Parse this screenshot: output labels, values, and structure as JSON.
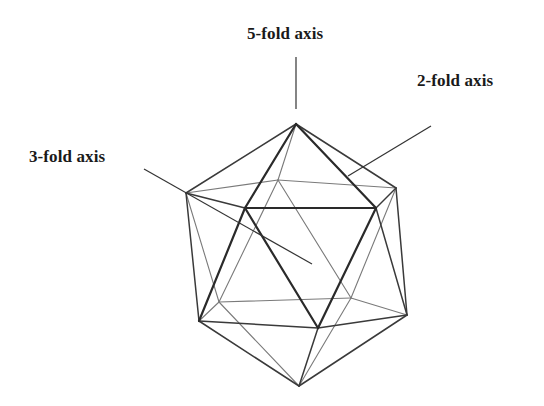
{
  "figure": {
    "labels": {
      "five_fold": "5-fold axis",
      "two_fold": "2-fold axis",
      "three_fold": "3-fold axis"
    },
    "colors": {
      "background": "#ffffff",
      "front_edge": "#2a2a2a",
      "back_edge": "#7a7a7a",
      "text": "#1a1a1a"
    }
  }
}
